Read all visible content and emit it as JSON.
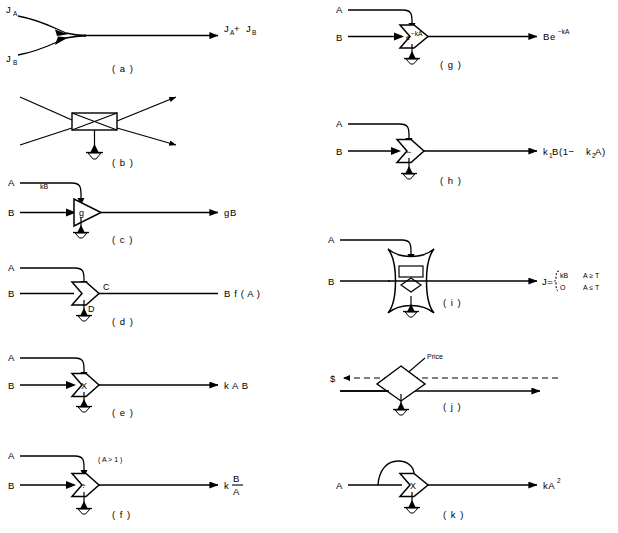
{
  "figure": {
    "stroke_color": "#000000",
    "background": "#ffffff"
  },
  "panels": [
    {
      "id": "a",
      "label": "( a )",
      "name": "junction-of-flows",
      "inputs": [
        "J",
        "J"
      ],
      "input_labels": [
        "J_A",
        "J_B"
      ],
      "input_main": "J",
      "input_sub_a": "A",
      "input_sub_b": "B",
      "output": "J_A + J_B",
      "output_parts": {
        "j1": "J",
        "s1": "A",
        "plus": " + ",
        "j2": "J",
        "s2": "B"
      },
      "symbol": "curved-merge"
    },
    {
      "id": "b",
      "label": "( b )",
      "name": "interaction-crossing-box",
      "inputs": [],
      "output": "",
      "symbol": "crossed-rectangle",
      "has_ground": true
    },
    {
      "id": "c",
      "label": "( c )",
      "name": "amplifier-gain",
      "input_a": "A",
      "input_b": "B",
      "control_label": "kB",
      "inner": "g",
      "output": "gB",
      "symbol": "triangle-amplifier",
      "has_ground": true
    },
    {
      "id": "d",
      "label": "( d )",
      "name": "general-interaction-function",
      "input_a": "A",
      "input_b": "B",
      "inner": "",
      "node_label_c": "C",
      "node_label_d": "D",
      "output": "B f ( A )",
      "symbol": "bullet",
      "has_ground": true
    },
    {
      "id": "e",
      "label": "( e )",
      "name": "multiplier",
      "input_a": "A",
      "input_b": "B",
      "inner": "X",
      "output": "k A B",
      "symbol": "bullet",
      "has_ground": true
    },
    {
      "id": "f",
      "label": "( f )",
      "name": "divider",
      "input_a": "A",
      "input_b": "B",
      "control_label": "( A > 1 )",
      "inner": "÷",
      "output_k": "k",
      "output_num": "B",
      "output_den": "A",
      "symbol": "bullet",
      "has_ground": true
    },
    {
      "id": "g",
      "label": "( g )",
      "name": "exponential-decay",
      "input_a": "A",
      "input_b": "B",
      "inner_base": "e",
      "inner_exp": "−kA",
      "output_base": "Be",
      "output_exp": "−kA",
      "symbol": "bullet",
      "has_ground": true
    },
    {
      "id": "h",
      "label": "( h )",
      "name": "linear-drag-interaction",
      "input_a": "A",
      "input_b": "B",
      "inner": "−",
      "output_parts": {
        "k": "k",
        "k_sub": "1",
        "b": "B(1−",
        "k2": "k",
        "k2_sub": "2",
        "tail": "A)"
      },
      "output": "k₁B(1−k₂A)",
      "symbol": "bullet",
      "has_ground": true
    },
    {
      "id": "i",
      "label": "( i )",
      "name": "switching-action",
      "input_a": "A",
      "input_b": "B",
      "output_lead": "J=",
      "output_line1_val": "kB",
      "output_line1_cond": "A ≥ T",
      "output_line2_val": "O",
      "output_line2_cond": "A ≤ T",
      "symbol": "concave-star-switch",
      "has_ground": true
    },
    {
      "id": "j",
      "label": "( j )",
      "name": "economic-transaction",
      "money_label": "$",
      "price_label": "Price",
      "symbol": "diamond-transaction",
      "has_ground": true
    },
    {
      "id": "k",
      "label": "( k )",
      "name": "self-multiplier-squared",
      "input_a": "A",
      "inner": "X",
      "output_base": "kA",
      "output_exp": "2",
      "output": "kA²",
      "symbol": "bullet",
      "has_ground": true
    }
  ]
}
